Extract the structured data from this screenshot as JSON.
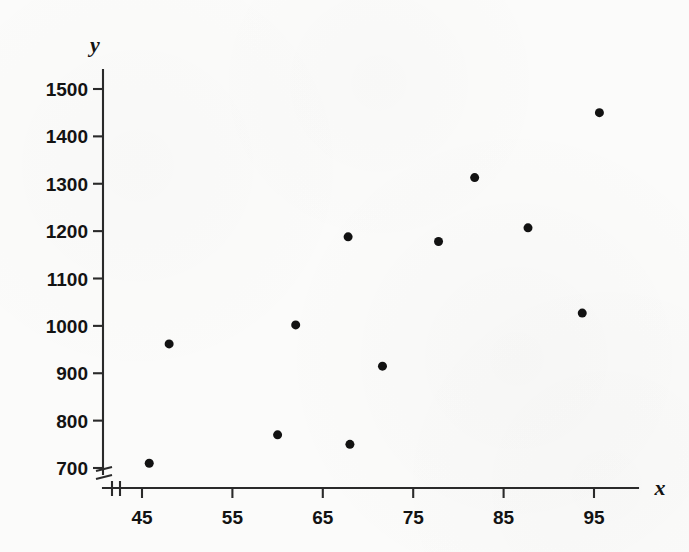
{
  "chart_data": {
    "type": "scatter",
    "title": "",
    "subtitle": "",
    "xlabel": "x",
    "ylabel": "y",
    "xlim": [
      40,
      100
    ],
    "ylim": [
      680,
      1530
    ],
    "xticks": [
      45,
      55,
      65,
      75,
      85,
      95
    ],
    "yticks": [
      700,
      800,
      900,
      1000,
      1100,
      1200,
      1300,
      1400,
      1500
    ],
    "xtick_labels": [
      "45",
      "55",
      "65",
      "75",
      "85",
      "95"
    ],
    "ytick_labels": [
      "700",
      "800",
      "900",
      "1000",
      "1100",
      "1200",
      "1300",
      "1400",
      "1500"
    ],
    "grid": false,
    "legend": null,
    "axis_break_x": true,
    "axis_break_y": true,
    "marker": "filled-circle",
    "marker_color": "#121212",
    "marker_size_px": 9,
    "n_points": 12,
    "points": [
      {
        "x": 45.8,
        "y": 710
      },
      {
        "x": 48.0,
        "y": 962
      },
      {
        "x": 60.0,
        "y": 770
      },
      {
        "x": 62.0,
        "y": 1002
      },
      {
        "x": 67.8,
        "y": 1188
      },
      {
        "x": 68.0,
        "y": 750
      },
      {
        "x": 71.6,
        "y": 915
      },
      {
        "x": 77.8,
        "y": 1178
      },
      {
        "x": 81.8,
        "y": 1313
      },
      {
        "x": 87.7,
        "y": 1207
      },
      {
        "x": 93.7,
        "y": 1027
      },
      {
        "x": 95.6,
        "y": 1450
      }
    ],
    "x": [
      45.8,
      48.0,
      60.0,
      62.0,
      67.8,
      68.0,
      71.6,
      77.8,
      81.8,
      87.7,
      93.7,
      95.6
    ],
    "values": [
      710,
      962,
      770,
      1002,
      1188,
      750,
      915,
      1178,
      1313,
      1207,
      1027,
      1450
    ]
  },
  "axis_names": {
    "x": "x",
    "y": "y"
  },
  "colors": {
    "background": "#fbfbfa",
    "axis": "#2a2a2a",
    "text": "#131313",
    "marker": "#121212"
  }
}
